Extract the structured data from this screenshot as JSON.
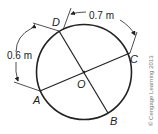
{
  "diagram": {
    "points": {
      "A": "A",
      "B": "B",
      "C": "C",
      "D": "D",
      "O": "O"
    },
    "dimensions": {
      "arc_DA": "0.6 m",
      "arc_DC": "0.7 m"
    },
    "copyright": "© Cengage Learning 2013"
  }
}
